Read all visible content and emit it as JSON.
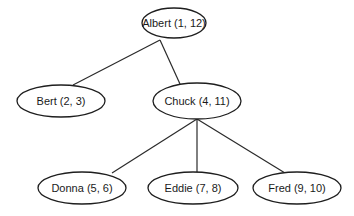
{
  "diagram": {
    "type": "tree",
    "nodes": [
      {
        "id": "albert",
        "label": "Albert (1, 12)",
        "cx": 174,
        "cy": 23,
        "rx": 32,
        "ry": 15
      },
      {
        "id": "bert",
        "label": "Bert (2, 3)",
        "cx": 61,
        "cy": 101,
        "rx": 44,
        "ry": 16
      },
      {
        "id": "chuck",
        "label": "Chuck (4, 11)",
        "cx": 197,
        "cy": 101,
        "rx": 44,
        "ry": 18
      },
      {
        "id": "donna",
        "label": "Donna (5, 6)",
        "cx": 82,
        "cy": 188,
        "rx": 44,
        "ry": 16
      },
      {
        "id": "eddie",
        "label": "Eddie (7, 8)",
        "cx": 193,
        "cy": 188,
        "rx": 45,
        "ry": 16
      },
      {
        "id": "fred",
        "label": "Fred (9, 10)",
        "cx": 297,
        "cy": 188,
        "rx": 44,
        "ry": 16
      }
    ],
    "edges": [
      {
        "from": "albert",
        "to": "bert",
        "x1": 160,
        "y1": 40,
        "x2": 73,
        "y2": 85
      },
      {
        "from": "albert",
        "to": "chuck",
        "x1": 160,
        "y1": 40,
        "x2": 180,
        "y2": 84
      },
      {
        "from": "chuck",
        "to": "donna",
        "x1": 197,
        "y1": 119,
        "x2": 112,
        "y2": 173
      },
      {
        "from": "chuck",
        "to": "eddie",
        "x1": 197,
        "y1": 119,
        "x2": 197,
        "y2": 172
      },
      {
        "from": "chuck",
        "to": "fred",
        "x1": 197,
        "y1": 119,
        "x2": 285,
        "y2": 173
      }
    ]
  }
}
